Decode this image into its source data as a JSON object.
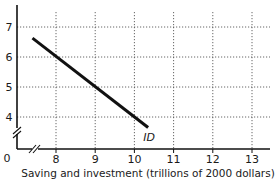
{
  "chart_data": {
    "type": "line",
    "title": "",
    "xlabel": "Saving and investment (trillions of 2000 dollars)",
    "ylabel": "",
    "origin_label": "0",
    "x_ticks": [
      "8",
      "9",
      "10",
      "11",
      "12",
      "13"
    ],
    "y_ticks": [
      "4",
      "5",
      "6",
      "7"
    ],
    "xlim": [
      7,
      13.5
    ],
    "ylim": [
      3,
      7.5
    ],
    "axis_breaks": [
      "x",
      "y"
    ],
    "grid": true,
    "series": [
      {
        "name": "ID",
        "label": "ID",
        "x": [
          7.4,
          10.35
        ],
        "y": [
          6.63,
          3.65
        ],
        "color": "#111111"
      }
    ],
    "colors": {
      "axis": "#111111",
      "grid": "#555555",
      "line": "#111111"
    }
  }
}
